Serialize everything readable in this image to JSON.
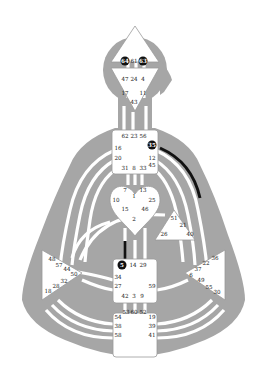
{
  "colors": {
    "background": "#ffffff",
    "body": "#a6a6a6",
    "channel": "#ffffff",
    "center": "#ffffff",
    "center_border": "#9a9a9a",
    "active": "#111111"
  },
  "centers": {
    "head": {
      "gates": [
        "64",
        "61",
        "63"
      ],
      "active": [
        "64",
        "63"
      ]
    },
    "ajna": {
      "gates": [
        "47",
        "24",
        "4",
        "17",
        "11",
        "43"
      ]
    },
    "throat": {
      "gates": [
        "62",
        "23",
        "56",
        "16",
        "35",
        "20",
        "12",
        "31",
        "8",
        "33",
        "45"
      ],
      "active": [
        "35"
      ]
    },
    "g": {
      "gates": [
        "7",
        "1",
        "13",
        "10",
        "25",
        "15",
        "46",
        "2"
      ]
    },
    "heart": {
      "gates": [
        "51",
        "21",
        "26",
        "40"
      ]
    },
    "spleen": {
      "gates": [
        "48",
        "57",
        "44",
        "50",
        "32",
        "28",
        "18"
      ]
    },
    "solar_plexus": {
      "gates": [
        "36",
        "22",
        "37",
        "6",
        "49",
        "55",
        "30"
      ]
    },
    "sacral": {
      "gates": [
        "5",
        "14",
        "29",
        "34",
        "27",
        "59",
        "42",
        "3",
        "9"
      ],
      "active": [
        "5"
      ]
    },
    "root": {
      "gates": [
        "53",
        "60",
        "52",
        "54",
        "38",
        "58",
        "19",
        "39",
        "41"
      ]
    }
  },
  "active_channels": [
    {
      "from": "35",
      "to": "36",
      "name": "throat-to-solar-plexus"
    },
    {
      "from": "2",
      "to": "5",
      "name": "g-to-sacral"
    }
  ]
}
